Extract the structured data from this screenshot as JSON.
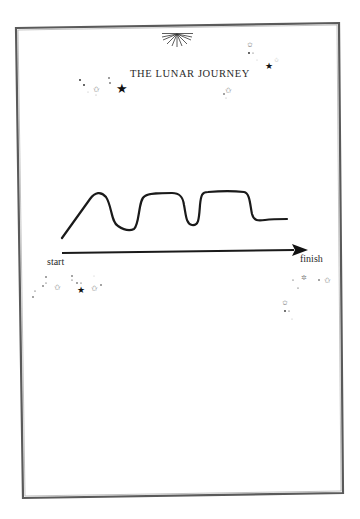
{
  "page": {
    "title": "THE LUNAR JOURNEY",
    "ornament": "sunburst-ornament",
    "frame_color": "#555555"
  },
  "diagram": {
    "type": "journey-line",
    "curve_description": "rise to peak, dip, plateau, dip, plateau, drop, flat",
    "axis": {
      "start_label": "start",
      "finish_label": "finish",
      "direction": "left-to-right arrow"
    },
    "line_color": "#1a1a1a"
  },
  "decorations": {
    "star_clusters": [
      "top-left-cluster",
      "top-right-cluster",
      "bottom-left-cluster",
      "bottom-right-cluster"
    ]
  }
}
